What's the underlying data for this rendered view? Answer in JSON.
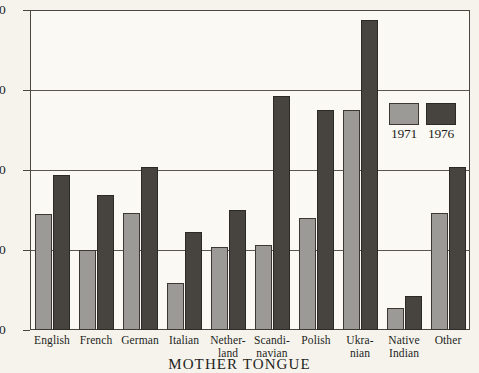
{
  "chart_data": {
    "type": "bar",
    "title": "",
    "xlabel": "MOTHER TONGUE",
    "ylabel": "",
    "ylim": [
      0,
      40
    ],
    "yticks": [
      0,
      10,
      20,
      30,
      40
    ],
    "ytick_labels": [
      "0",
      "10",
      "20",
      "30",
      "40"
    ],
    "grid": true,
    "legend_position": "inside-right",
    "categories": [
      "English",
      "French",
      "German",
      "Italian",
      "Nether-land",
      "Scandi-navian",
      "Polish",
      "Ukra-nian",
      "Native Indian",
      "Other"
    ],
    "category_lines": [
      [
        "English"
      ],
      [
        "French"
      ],
      [
        "German"
      ],
      [
        "Italian"
      ],
      [
        "Nether-",
        "land"
      ],
      [
        "Scandi-",
        "navian"
      ],
      [
        "Polish"
      ],
      [
        "Ukra-",
        "nian"
      ],
      [
        "Native",
        "Indian"
      ],
      [
        "Other"
      ]
    ],
    "series": [
      {
        "name": "1971",
        "color": "#9c9a96",
        "values": [
          14.5,
          10.0,
          14.6,
          5.9,
          10.4,
          10.6,
          14.0,
          27.5,
          2.8,
          14.6
        ]
      },
      {
        "name": "1976",
        "color": "#474440",
        "values": [
          19.4,
          16.9,
          20.4,
          12.3,
          15.0,
          29.3,
          27.5,
          38.7,
          4.3,
          20.4
        ]
      }
    ]
  },
  "legend": {
    "entries": [
      {
        "label": "1971",
        "color": "#9c9a96"
      },
      {
        "label": "1976",
        "color": "#474440"
      }
    ]
  },
  "colors": {
    "background": "#f6f3ec",
    "plot_background": "#fbf9f3",
    "axis": "#4a4743",
    "series_1971": "#9c9a96",
    "series_1976": "#474440"
  }
}
